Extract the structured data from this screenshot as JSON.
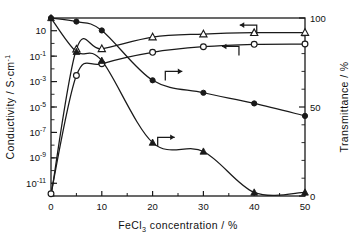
{
  "chart_data": {
    "type": "line",
    "title": "",
    "xlabel": "FeCl3 concentration / %",
    "xlabel_parts": {
      "pre": "FeCl",
      "sub": "3",
      "post": " concentration / %"
    },
    "ylabel": "Conductivity / S·cm⁻¹",
    "ylabel_parts": {
      "pre": "Conductivity / S·cm",
      "sup": "-1"
    },
    "y2label": "Transmittance / %",
    "xlim": [
      0,
      50
    ],
    "xticks": [
      0,
      10,
      20,
      30,
      40,
      50
    ],
    "xticklabels": [
      "0",
      "10",
      "20",
      "30",
      "40",
      "50"
    ],
    "yscale": "log",
    "ylim": [
      1e-12,
      100
    ],
    "yticks": [
      10,
      0.1,
      0.001,
      1e-05,
      1e-07,
      1e-09,
      1e-11
    ],
    "yticklabels": [
      "10",
      "10-1",
      "10-3",
      "10-5",
      "10-7",
      "10-9",
      "10-11"
    ],
    "ytick_mantissa": [
      "10",
      "10",
      "10",
      "10",
      "10",
      "10",
      "10"
    ],
    "ytick_exponent": [
      "",
      "-1",
      "-3",
      "-5",
      "-7",
      "-9",
      "-11"
    ],
    "y2lim": [
      0,
      100
    ],
    "y2ticks": [
      0,
      50,
      100
    ],
    "y2ticklabels": [
      "0",
      "50",
      "100"
    ],
    "y2_minor_ticks": [
      10,
      20,
      30,
      40,
      60,
      70,
      80,
      90
    ],
    "grid": false,
    "legend": "none",
    "series": [
      {
        "name": "Conductivity (open triangle)",
        "marker": "open-triangle",
        "axis": "left",
        "arrow": "left",
        "x": [
          0,
          5,
          10,
          20,
          30,
          40,
          50
        ],
        "values": [
          1e-12,
          0.35,
          0.38,
          3.2,
          5.5,
          7.0,
          7.2
        ]
      },
      {
        "name": "Conductivity (open circle)",
        "marker": "open-circle",
        "axis": "left",
        "arrow": "left",
        "x": [
          0,
          5,
          10,
          20,
          30,
          40,
          50
        ],
        "values": [
          1.5e-12,
          0.003,
          0.025,
          0.2,
          0.55,
          0.85,
          0.9
        ]
      },
      {
        "name": "Transmittance (filled circle)",
        "marker": "filled-circle",
        "axis": "right",
        "arrow": "right",
        "x": [
          0,
          5,
          10,
          20,
          30,
          40,
          50
        ],
        "values": [
          100,
          98,
          93,
          65,
          58,
          52,
          45
        ]
      },
      {
        "name": "Transmittance (filled triangle)",
        "marker": "filled-triangle",
        "axis": "right",
        "arrow": "right",
        "x": [
          0,
          5,
          10,
          20,
          30,
          40,
          50
        ],
        "values": [
          100,
          81,
          76,
          30,
          25,
          2,
          2
        ]
      }
    ],
    "annotations": [
      {
        "name": "arrow-left-upper",
        "direction": "left",
        "x": 40.5,
        "y_axis": "right",
        "y": 96
      },
      {
        "name": "arrow-left-lower",
        "direction": "left",
        "x": 37.0,
        "y_axis": "right",
        "y": 84
      },
      {
        "name": "arrow-right-upper",
        "direction": "right",
        "x": 22.5,
        "y_axis": "right",
        "y": 70
      },
      {
        "name": "arrow-right-lower",
        "direction": "right",
        "x": 21.0,
        "y_axis": "right",
        "y": 33
      }
    ],
    "colors": {
      "line": "#1a1a1a",
      "marker": "#1a1a1a",
      "background": "#ffffff",
      "frame": "#1a1a1a"
    }
  }
}
